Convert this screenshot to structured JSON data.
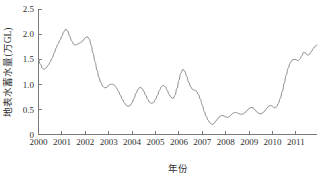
{
  "chart_data": {
    "type": "line",
    "title": "",
    "subtitle": "",
    "xlabel": "年份",
    "ylabel": "地表水蓄水量(万GL)",
    "xlim": [
      2000,
      2011.9
    ],
    "ylim": [
      0,
      2.5
    ],
    "grid": false,
    "legend": null,
    "yticks": [
      "0",
      "0.5",
      "1.0",
      "1.5",
      "2.0",
      "2.5"
    ],
    "ytick_values": [
      0,
      0.5,
      1.0,
      1.5,
      2.0,
      2.5
    ],
    "xticks": [
      "2000",
      "2001",
      "2002",
      "2003",
      "2004",
      "2005",
      "2006",
      "2007",
      "2008",
      "2009",
      "2010",
      "2011"
    ],
    "xtick_values": [
      2000,
      2001,
      2002,
      2003,
      2004,
      2005,
      2006,
      2007,
      2008,
      2009,
      2010,
      2011
    ],
    "line_color": "#8a8a8a",
    "axis_color": "#7a7a7a",
    "series": [
      {
        "name": "地表水蓄水量",
        "x": [
          2000.0,
          2000.08,
          2000.17,
          2000.25,
          2000.33,
          2000.42,
          2000.5,
          2000.58,
          2000.67,
          2000.75,
          2000.83,
          2000.92,
          2001.0,
          2001.08,
          2001.17,
          2001.25,
          2001.33,
          2001.42,
          2001.5,
          2001.58,
          2001.67,
          2001.75,
          2001.83,
          2001.92,
          2002.0,
          2002.08,
          2002.17,
          2002.25,
          2002.33,
          2002.42,
          2002.5,
          2002.58,
          2002.67,
          2002.75,
          2002.83,
          2002.92,
          2003.0,
          2003.08,
          2003.17,
          2003.25,
          2003.33,
          2003.42,
          2003.5,
          2003.58,
          2003.67,
          2003.75,
          2003.83,
          2003.92,
          2004.0,
          2004.08,
          2004.17,
          2004.25,
          2004.33,
          2004.42,
          2004.5,
          2004.58,
          2004.67,
          2004.75,
          2004.83,
          2004.92,
          2005.0,
          2005.08,
          2005.17,
          2005.25,
          2005.33,
          2005.42,
          2005.5,
          2005.58,
          2005.67,
          2005.75,
          2005.83,
          2005.92,
          2006.0,
          2006.08,
          2006.17,
          2006.25,
          2006.33,
          2006.42,
          2006.5,
          2006.58,
          2006.67,
          2006.75,
          2006.83,
          2006.92,
          2007.0,
          2007.08,
          2007.17,
          2007.25,
          2007.33,
          2007.42,
          2007.5,
          2007.58,
          2007.67,
          2007.75,
          2007.83,
          2007.92,
          2008.0,
          2008.08,
          2008.17,
          2008.25,
          2008.33,
          2008.42,
          2008.5,
          2008.58,
          2008.67,
          2008.75,
          2008.83,
          2008.92,
          2009.0,
          2009.08,
          2009.17,
          2009.25,
          2009.33,
          2009.42,
          2009.5,
          2009.58,
          2009.67,
          2009.75,
          2009.83,
          2009.92,
          2010.0,
          2010.08,
          2010.17,
          2010.25,
          2010.33,
          2010.42,
          2010.5,
          2010.58,
          2010.67,
          2010.75,
          2010.83,
          2010.92,
          2011.0,
          2011.08,
          2011.17,
          2011.25,
          2011.33,
          2011.42,
          2011.5,
          2011.58,
          2011.67,
          2011.75,
          2011.83,
          2011.9
        ],
        "values": [
          1.5,
          1.4,
          1.32,
          1.3,
          1.33,
          1.38,
          1.45,
          1.52,
          1.62,
          1.72,
          1.8,
          1.88,
          1.96,
          2.05,
          2.1,
          2.06,
          1.96,
          1.86,
          1.8,
          1.78,
          1.8,
          1.82,
          1.84,
          1.88,
          1.93,
          1.95,
          1.9,
          1.78,
          1.62,
          1.44,
          1.28,
          1.14,
          1.03,
          0.96,
          0.93,
          0.94,
          0.98,
          1.0,
          1.0,
          0.98,
          0.93,
          0.86,
          0.78,
          0.7,
          0.63,
          0.58,
          0.56,
          0.58,
          0.63,
          0.72,
          0.82,
          0.9,
          0.94,
          0.92,
          0.86,
          0.78,
          0.7,
          0.64,
          0.62,
          0.64,
          0.7,
          0.78,
          0.88,
          0.95,
          0.98,
          0.95,
          0.88,
          0.8,
          0.74,
          0.72,
          0.78,
          0.92,
          1.08,
          1.22,
          1.3,
          1.26,
          1.16,
          1.04,
          0.95,
          0.9,
          0.88,
          0.86,
          0.8,
          0.7,
          0.58,
          0.46,
          0.36,
          0.28,
          0.23,
          0.2,
          0.22,
          0.27,
          0.32,
          0.36,
          0.38,
          0.37,
          0.35,
          0.34,
          0.36,
          0.4,
          0.43,
          0.44,
          0.43,
          0.41,
          0.4,
          0.41,
          0.44,
          0.48,
          0.52,
          0.54,
          0.53,
          0.49,
          0.45,
          0.42,
          0.41,
          0.43,
          0.47,
          0.52,
          0.56,
          0.58,
          0.56,
          0.53,
          0.55,
          0.62,
          0.72,
          0.86,
          1.02,
          1.18,
          1.32,
          1.42,
          1.48,
          1.5,
          1.49,
          1.47,
          1.5,
          1.57,
          1.64,
          1.62,
          1.58,
          1.6,
          1.66,
          1.72,
          1.76,
          1.78
        ]
      }
    ]
  }
}
